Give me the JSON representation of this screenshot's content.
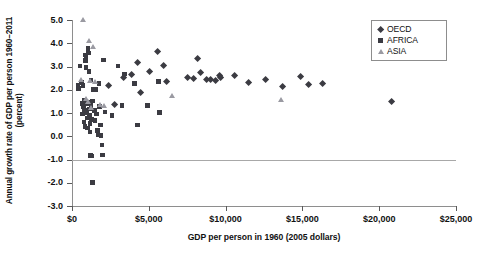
{
  "chart_data": {
    "type": "scatter",
    "title": "",
    "xlabel": "GDP per person in 1960 (2005 dollars)",
    "ylabel": "Annual growth rate of GDP per person 1960–2011 (percent)",
    "xlim": [
      0,
      25000
    ],
    "ylim": [
      -3.0,
      5.0
    ],
    "xticks": [
      0,
      5000,
      10000,
      15000,
      20000,
      25000
    ],
    "xtick_labels": [
      "$0",
      "$5,000",
      "$10,000",
      "$15,000",
      "$20,000",
      "$25,000"
    ],
    "yticks": [
      5.0,
      4.0,
      3.0,
      2.0,
      1.0,
      0.0,
      -1.0,
      -2.0,
      -3.0
    ],
    "ytick_labels": [
      "5.0",
      "4.0",
      "3.0",
      "2.0",
      "1.0",
      "0.0",
      "-1.0",
      "-2.0",
      "-3.0"
    ],
    "grid": false,
    "zero_reference_line": 0.0,
    "legend_position": "top-right",
    "legend": [
      "OECD",
      "AFRICA",
      "ASIA"
    ],
    "marker_colors": {
      "OECD": "#3b3b42",
      "AFRICA": "#3b3b42",
      "ASIA": "#9a9aa2"
    },
    "marker_shapes": {
      "OECD": "diamond",
      "AFRICA": "square",
      "ASIA": "triangle"
    },
    "series": [
      {
        "name": "OECD",
        "points": [
          [
            3380,
            2.52
          ],
          [
            3900,
            2.65
          ],
          [
            4250,
            3.15
          ],
          [
            4470,
            1.88
          ],
          [
            5050,
            2.78
          ],
          [
            5600,
            3.65
          ],
          [
            5950,
            3.05
          ],
          [
            6150,
            2.35
          ],
          [
            7500,
            2.52
          ],
          [
            7900,
            2.48
          ],
          [
            8150,
            3.35
          ],
          [
            8400,
            2.75
          ],
          [
            8750,
            2.42
          ],
          [
            9050,
            2.45
          ],
          [
            9350,
            2.38
          ],
          [
            9600,
            2.6
          ],
          [
            9700,
            2.52
          ],
          [
            10600,
            2.6
          ],
          [
            11500,
            2.3
          ],
          [
            12600,
            2.42
          ],
          [
            13700,
            2.12
          ],
          [
            14850,
            2.58
          ],
          [
            15400,
            2.22
          ],
          [
            16300,
            2.28
          ],
          [
            20800,
            1.48
          ],
          [
            2400,
            2.18
          ],
          [
            2750,
            1.35
          ]
        ]
      },
      {
        "name": "AFRICA",
        "points": [
          [
            380,
            2.2
          ],
          [
            420,
            2.05
          ],
          [
            520,
            3.02
          ],
          [
            600,
            2.32
          ],
          [
            680,
            1.42
          ],
          [
            700,
            0.95
          ],
          [
            720,
            2.18
          ],
          [
            760,
            1.25
          ],
          [
            780,
            0.62
          ],
          [
            800,
            1.55
          ],
          [
            820,
            1.12
          ],
          [
            840,
            0.42
          ],
          [
            860,
            3.5
          ],
          [
            880,
            3.25
          ],
          [
            900,
            3.38
          ],
          [
            920,
            2.95
          ],
          [
            940,
            1.38
          ],
          [
            960,
            1.02
          ],
          [
            980,
            0.78
          ],
          [
            1000,
            0.35
          ],
          [
            1020,
            1.48
          ],
          [
            1050,
            3.78
          ],
          [
            1080,
            3.58
          ],
          [
            1100,
            2.78
          ],
          [
            1120,
            1.18
          ],
          [
            1140,
            0.88
          ],
          [
            1160,
            0.55
          ],
          [
            1180,
            0.18
          ],
          [
            1200,
            -0.82
          ],
          [
            1250,
            1.32
          ],
          [
            1280,
            0.72
          ],
          [
            1300,
            -0.85
          ],
          [
            1320,
            -1.98
          ],
          [
            1400,
            2.02
          ],
          [
            1450,
            1.1
          ],
          [
            1500,
            0.68
          ],
          [
            1550,
            2.02
          ],
          [
            1600,
            0.95
          ],
          [
            1650,
            0.25
          ],
          [
            1700,
            0.05
          ],
          [
            1750,
            2.28
          ],
          [
            1800,
            1.28
          ],
          [
            1850,
            0.48
          ],
          [
            1900,
            0.02
          ],
          [
            1950,
            -0.38
          ],
          [
            2000,
            -0.8
          ],
          [
            2050,
            3.28
          ],
          [
            2150,
            1.05
          ],
          [
            2600,
            0.88
          ],
          [
            3000,
            3.02
          ],
          [
            3250,
            1.32
          ],
          [
            3400,
            2.68
          ],
          [
            4050,
            2.28
          ],
          [
            5650,
            2.35
          ],
          [
            5700,
            1.02
          ],
          [
            4900,
            1.32
          ],
          [
            4250,
            0.48
          ],
          [
            1250,
            2.42
          ],
          [
            1350,
            1.52
          ]
        ]
      },
      {
        "name": "ASIA",
        "points": [
          [
            700,
            4.98
          ],
          [
            1100,
            4.08
          ],
          [
            1400,
            3.85
          ],
          [
            620,
            2.42
          ],
          [
            1150,
            2.38
          ],
          [
            1500,
            2.32
          ],
          [
            900,
            1.62
          ],
          [
            1050,
            1.48
          ],
          [
            1800,
            1.35
          ],
          [
            2100,
            1.32
          ],
          [
            6500,
            1.72
          ],
          [
            13600,
            1.58
          ],
          [
            1250,
            1.22
          ]
        ]
      }
    ]
  }
}
